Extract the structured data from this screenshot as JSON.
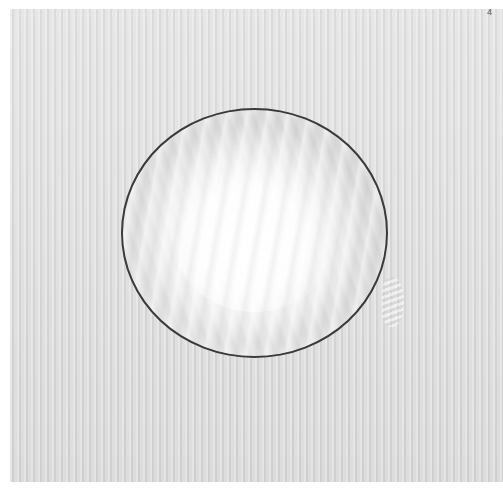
{
  "image": {
    "description": "Overhead photo of a round glass bowl covered tightly with clear plastic wrap on a striped light-gray surface",
    "page_number": "4",
    "colors": {
      "border": "#ffffff",
      "background": "#dcdcdc",
      "bowl_rim": "#3a3a3a",
      "wrap_highlight": "#ffffff"
    }
  }
}
